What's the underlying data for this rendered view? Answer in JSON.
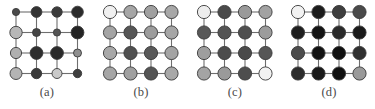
{
  "figure": {
    "background_color": "#ffffff",
    "edge_color": "#6e6e6e",
    "node_stroke_color": "#3a3a3a",
    "panel_count": 4,
    "grid_rows": 4,
    "grid_cols": 4
  },
  "panels": [
    {
      "id": "panel-a",
      "label": "(a)",
      "x": 0,
      "nodes": [
        [
          {
            "shade": "#4a4a4a",
            "r": 3.6
          },
          {
            "shade": "#333333",
            "r": 5.4
          },
          {
            "shade": "#3b3b3b",
            "r": 5.2
          },
          {
            "shade": "#2b2b2b",
            "r": 5.8
          }
        ],
        [
          {
            "shade": "#b7b7b7",
            "r": 6.2
          },
          {
            "shade": "#454545",
            "r": 4.0
          },
          {
            "shade": "#555555",
            "r": 3.6
          },
          {
            "shade": "#242424",
            "r": 6.4
          }
        ],
        [
          {
            "shade": "#b0b0b0",
            "r": 5.6
          },
          {
            "shade": "#2e2e2e",
            "r": 6.4
          },
          {
            "shade": "#2a2a2a",
            "r": 6.4
          },
          {
            "shade": "#8f8f8f",
            "r": 4.0
          }
        ],
        [
          {
            "shade": "#b4b4b4",
            "r": 6.0
          },
          {
            "shade": "#3a3a3a",
            "r": 5.2
          },
          {
            "shade": "#c9c9c9",
            "r": 5.0
          },
          {
            "shade": "#3f3f3f",
            "r": 4.2
          }
        ]
      ]
    },
    {
      "id": "panel-b",
      "label": "(b)",
      "x": 94,
      "nodes": [
        [
          {
            "shade": "#f0f0f0",
            "r": 6.6
          },
          {
            "shade": "#a6a6a6",
            "r": 6.6
          },
          {
            "shade": "#a0a0a0",
            "r": 6.6
          },
          {
            "shade": "#a8a8a8",
            "r": 6.6
          }
        ],
        [
          {
            "shade": "#a4a4a4",
            "r": 6.6
          },
          {
            "shade": "#565656",
            "r": 6.6
          },
          {
            "shade": "#9c9c9c",
            "r": 6.6
          },
          {
            "shade": "#a6a6a6",
            "r": 6.6
          }
        ],
        [
          {
            "shade": "#a8a8a8",
            "r": 6.6
          },
          {
            "shade": "#505050",
            "r": 6.6
          },
          {
            "shade": "#585858",
            "r": 6.6
          },
          {
            "shade": "#a4a4a4",
            "r": 6.6
          }
        ],
        [
          {
            "shade": "#a6a6a6",
            "r": 6.6
          },
          {
            "shade": "#a0a0a0",
            "r": 6.6
          },
          {
            "shade": "#545454",
            "r": 6.6
          },
          {
            "shade": "#a8a8a8",
            "r": 6.6
          }
        ]
      ]
    },
    {
      "id": "panel-c",
      "label": "(c)",
      "x": 188,
      "nodes": [
        [
          {
            "shade": "#ededed",
            "r": 6.6
          },
          {
            "shade": "#4a4a4a",
            "r": 6.6
          },
          {
            "shade": "#9a9a9a",
            "r": 6.6
          },
          {
            "shade": "#a2a2a2",
            "r": 6.6
          }
        ],
        [
          {
            "shade": "#585858",
            "r": 6.6
          },
          {
            "shade": "#545454",
            "r": 6.6
          },
          {
            "shade": "#4e4e4e",
            "r": 6.6
          },
          {
            "shade": "#9c9c9c",
            "r": 6.6
          }
        ],
        [
          {
            "shade": "#9e9e9e",
            "r": 6.6
          },
          {
            "shade": "#4c4c4c",
            "r": 6.6
          },
          {
            "shade": "#4a4a4a",
            "r": 6.6
          },
          {
            "shade": "#565656",
            "r": 6.6
          }
        ],
        [
          {
            "shade": "#a4a4a4",
            "r": 6.6
          },
          {
            "shade": "#9a9a9a",
            "r": 6.6
          },
          {
            "shade": "#4e4e4e",
            "r": 6.6
          },
          {
            "shade": "#f2f2f2",
            "r": 6.6
          }
        ]
      ]
    },
    {
      "id": "panel-d",
      "label": "(d)",
      "x": 282,
      "nodes": [
        [
          {
            "shade": "#f2f2f2",
            "r": 6.6
          },
          {
            "shade": "#1c1c1c",
            "r": 6.6
          },
          {
            "shade": "#3e3e3e",
            "r": 6.6
          },
          {
            "shade": "#4a4a4a",
            "r": 6.6
          }
        ],
        [
          {
            "shade": "#1e1e1e",
            "r": 6.6
          },
          {
            "shade": "#141414",
            "r": 6.6
          },
          {
            "shade": "#2a2a2a",
            "r": 6.6
          },
          {
            "shade": "#1a1a1a",
            "r": 6.6
          }
        ],
        [
          {
            "shade": "#4c4c4c",
            "r": 6.6
          },
          {
            "shade": "#121212",
            "r": 6.6
          },
          {
            "shade": "#101010",
            "r": 6.6
          },
          {
            "shade": "#303030",
            "r": 6.6
          }
        ],
        [
          {
            "shade": "#2c2c2c",
            "r": 6.6
          },
          {
            "shade": "#1a1a1a",
            "r": 6.6
          },
          {
            "shade": "#101010",
            "r": 6.6
          },
          {
            "shade": "#9a9a9a",
            "r": 6.6
          }
        ]
      ]
    }
  ]
}
